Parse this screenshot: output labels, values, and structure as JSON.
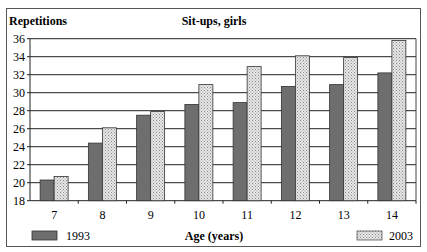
{
  "chart_data": {
    "type": "bar",
    "title": "Sit-ups, girls",
    "ylabel": "Repetitions",
    "xlabel": "Age (years)",
    "categories": [
      "7",
      "8",
      "9",
      "10",
      "11",
      "12",
      "13",
      "14"
    ],
    "series": [
      {
        "name": "1993",
        "values": [
          20.3,
          24.4,
          27.5,
          28.7,
          28.9,
          30.7,
          30.9,
          32.2
        ],
        "color": "#6e6e6e",
        "pattern": "solid-dark"
      },
      {
        "name": "2003",
        "values": [
          20.7,
          26.1,
          27.9,
          30.9,
          32.9,
          34.1,
          33.9,
          35.8
        ],
        "color": "#d8d8d8",
        "pattern": "dotted-light"
      }
    ],
    "ylim": [
      18,
      36
    ],
    "yticks": [
      18,
      20,
      22,
      24,
      26,
      28,
      30,
      32,
      34,
      36
    ],
    "grid": true,
    "legend_position": "bottom (1993 left, 2003 right)"
  },
  "labels": {
    "title": "Sit-ups, girls",
    "ylabel": "Repetitions",
    "xlabel": "Age (years)",
    "legend_1993": "1993",
    "legend_2003": "2003"
  }
}
